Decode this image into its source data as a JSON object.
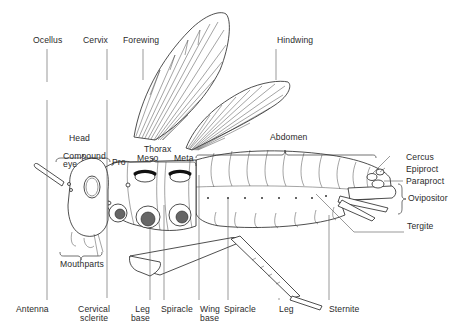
{
  "diagram": {
    "labels": {
      "ocellus": "Ocellus",
      "cervix": "Cervix",
      "forewing": "Forewing",
      "hindwing": "Hindwing",
      "head": "Head",
      "compound_eye_1": "Compound",
      "compound_eye_2": "eye",
      "thorax": "Thorax",
      "pro": "Pro",
      "meso": "Meso",
      "meta": "Meta",
      "abdomen": "Abdomen",
      "cercus": "Cercus",
      "epiproct": "Epiproct",
      "paraproct": "Paraproct",
      "ovipositor": "Ovipositor",
      "tergite": "Tergite",
      "mouthparts": "Mouthparts",
      "antenna": "Antenna",
      "cervical_sclerite_1": "Cervical",
      "cervical_sclerite_2": "sclerite",
      "leg_base_1": "Leg",
      "leg_base_2": "base",
      "spiracle_1": "Spiracle",
      "wing_base_1": "Wing",
      "wing_base_2": "base",
      "spiracle_2": "Spiracle",
      "leg": "Leg",
      "sternite": "Sternite"
    }
  }
}
